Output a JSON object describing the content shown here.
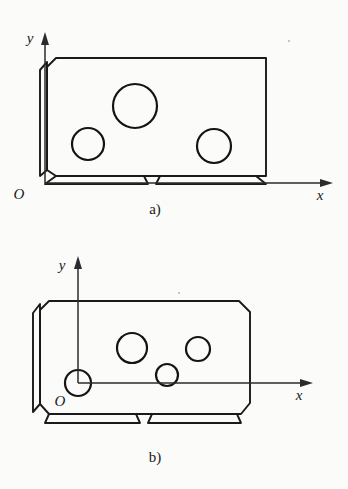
{
  "figure": {
    "background_color": "#fbfbf9",
    "line_color": "#1a1a1a",
    "subfigures": [
      {
        "id": "a",
        "caption": "a)",
        "caption_pos": [
          155,
          214
        ],
        "axes": {
          "x_label": "x",
          "y_label": "y",
          "origin_label": "O",
          "origin_point": [
            45,
            183
          ],
          "x_axis_end": [
            333,
            183
          ],
          "y_axis_end": [
            45,
            32
          ],
          "x_label_pos": [
            320,
            200
          ],
          "y_label_pos": [
            30,
            43
          ],
          "origin_label_pos": [
            19,
            199
          ],
          "origin_inside_part": false
        },
        "body": {
          "left": 47,
          "top": 58,
          "right": 266,
          "bottom": 176,
          "chamfer": 9,
          "side_strip_width": 7
        },
        "holes": [
          {
            "name": "large-hole",
            "cx": 135,
            "cy": 106,
            "r": 22
          },
          {
            "name": "left-hole",
            "cx": 88,
            "cy": 144,
            "r": 16
          },
          {
            "name": "right-hole",
            "cx": 214,
            "cy": 146,
            "r": 17
          }
        ],
        "foot": {
          "top": 176,
          "bottom": 185,
          "notch_center": 150,
          "notch_width": 16
        }
      },
      {
        "id": "b",
        "caption": "b)",
        "caption_pos": [
          155,
          462
        ],
        "axes": {
          "x_label": "x",
          "y_label": "y",
          "origin_label": "O",
          "origin_point": [
            78,
            383
          ],
          "x_axis_end": [
            313,
            383
          ],
          "y_axis_end": [
            78,
            256
          ],
          "x_label_pos": [
            299,
            400
          ],
          "y_label_pos": [
            62,
            270
          ],
          "origin_label_pos": [
            60,
            406
          ],
          "origin_inside_part": true,
          "origin_hole": {
            "name": "origin-reference-hole",
            "cx": 78,
            "cy": 383,
            "r": 13
          }
        },
        "body": {
          "left": 40,
          "top": 301,
          "right": 250,
          "bottom": 414,
          "chamfer": 12,
          "side_strip_width": 7
        },
        "holes": [
          {
            "name": "large-hole",
            "cx": 132,
            "cy": 348,
            "r": 15
          },
          {
            "name": "right-hole",
            "cx": 198,
            "cy": 349,
            "r": 12
          },
          {
            "name": "small-hole",
            "cx": 167,
            "cy": 375,
            "r": 11
          }
        ],
        "foot": {
          "top": 414,
          "bottom": 424,
          "notch_center": 146,
          "notch_width": 12
        }
      }
    ]
  }
}
